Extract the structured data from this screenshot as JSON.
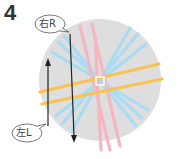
{
  "step": {
    "number": "4"
  },
  "labels": {
    "right": "右R",
    "left": "左L"
  },
  "colors": {
    "circle": "#dedede",
    "pink": "#f5b6c0",
    "blue": "#a9dcf3",
    "orange": "#f8c451",
    "arrow": "#222222",
    "bubble_stroke": "#555555"
  },
  "arrows": [
    {
      "name": "left-arrow",
      "direction": "up"
    },
    {
      "name": "right-arrow",
      "direction": "down"
    }
  ]
}
